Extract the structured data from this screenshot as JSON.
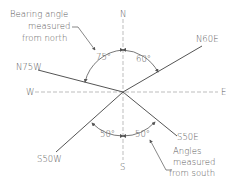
{
  "diagram": {
    "compass": {
      "north": "N",
      "south": "S",
      "east": "E",
      "west": "W"
    },
    "bearings": [
      {
        "label": "N60E",
        "angle": "60°"
      },
      {
        "label": "N75W",
        "angle": "75°"
      },
      {
        "label": "S50W",
        "angle": "50°"
      },
      {
        "label": "S50E",
        "angle": "50°"
      }
    ],
    "notes": {
      "north_note": [
        "Bearing angle",
        "measured",
        "from north"
      ],
      "south_note": [
        "Angles",
        "measured",
        "from south"
      ]
    }
  }
}
